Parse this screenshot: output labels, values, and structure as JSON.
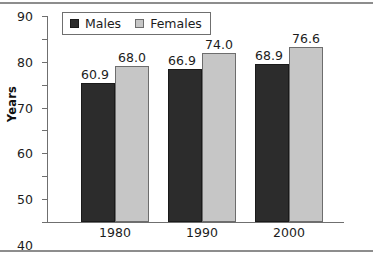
{
  "chart_data": {
    "type": "bar",
    "title": "",
    "subtitle": "",
    "xlabel": "",
    "ylabel": "Years",
    "categories": [
      "1980",
      "1990",
      "2000"
    ],
    "series": [
      {
        "name": "Males",
        "color": "#2c2c2c",
        "values": [
          60.9,
          66.9,
          68.9
        ],
        "labels": [
          "60.9",
          "66.9",
          "68.9"
        ]
      },
      {
        "name": "Females",
        "color": "#c6c6c6",
        "values": [
          68.0,
          74.0,
          76.6
        ],
        "labels": [
          "68.0",
          "74.0",
          "76.6"
        ]
      }
    ],
    "ylim": [
      0,
      90
    ],
    "yticks": [
      0,
      10,
      20,
      30,
      40,
      50,
      60,
      70,
      80,
      90
    ],
    "ytick_labels": [
      "0",
      "10",
      "20",
      "30",
      "40",
      "50",
      "60",
      "70",
      "80",
      "90"
    ],
    "grid": false,
    "legend_position": "top-left",
    "data_labels_shown": true
  },
  "legend": {
    "entries": [
      {
        "label": "Males",
        "swatch": "males-swatch"
      },
      {
        "label": "Females",
        "swatch": "females-swatch"
      }
    ]
  }
}
